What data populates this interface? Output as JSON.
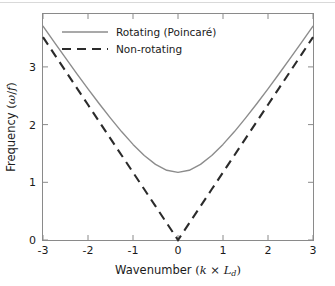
{
  "chart_data": {
    "type": "line",
    "title": "",
    "xlabel": "Wavenumber  (k × L_d)",
    "ylabel": "Frequency  (ω/f)",
    "xlim": [
      -3,
      3
    ],
    "ylim": [
      0,
      3.35
    ],
    "xticks": [
      -3,
      -2,
      -1,
      0,
      1,
      2,
      3
    ],
    "xticklabels": [
      "-3",
      "-2",
      "-1",
      "0",
      "1",
      "2",
      "3"
    ],
    "yticks": [
      0,
      1,
      2,
      3
    ],
    "yticklabels": [
      "0",
      "1",
      "2",
      "3"
    ],
    "grid": false,
    "legend_position": "upper-center",
    "x": [
      -3,
      -2.75,
      -2.5,
      -2.25,
      -2,
      -1.75,
      -1.5,
      -1.25,
      -1,
      -0.75,
      -0.5,
      -0.25,
      0,
      0.25,
      0.5,
      0.75,
      1,
      1.25,
      1.5,
      1.75,
      2,
      2.25,
      2.5,
      2.75,
      3
    ],
    "series": [
      {
        "name": "Rotating  (Poincaré)",
        "style": "solid",
        "color": "#8c8c8c",
        "formula": "omega/f = sqrt(1 + (k*Ld)^2)",
        "values": [
          3.162,
          2.926,
          2.693,
          2.462,
          2.236,
          2.015,
          1.803,
          1.6,
          1.414,
          1.25,
          1.118,
          1.031,
          1.0,
          1.031,
          1.118,
          1.25,
          1.414,
          1.6,
          1.803,
          2.015,
          2.236,
          2.462,
          2.693,
          2.926,
          3.162
        ]
      },
      {
        "name": "Non-rotating",
        "style": "dashed",
        "color": "#2b2b2b",
        "formula": "omega/f = |k*Ld|",
        "values": [
          3.0,
          2.75,
          2.5,
          2.25,
          2.0,
          1.75,
          1.5,
          1.25,
          1.0,
          0.75,
          0.5,
          0.25,
          0.0,
          0.25,
          0.5,
          0.75,
          1.0,
          1.25,
          1.5,
          1.75,
          2.0,
          2.25,
          2.5,
          2.75,
          3.0
        ]
      }
    ]
  },
  "axes": {
    "xlabel_prefix": "Wavenumber",
    "xlabel_math_k": "k",
    "xlabel_math_times": "×",
    "xlabel_math_L": "L",
    "xlabel_math_Lsub": "d",
    "ylabel_prefix": "Frequency",
    "ylabel_math_omega": "ω",
    "ylabel_math_slash": "/",
    "ylabel_math_f": "f",
    "paren_open": "(",
    "paren_close": ")"
  },
  "legend": {
    "items": [
      {
        "label": "Rotating  (Poincaré)",
        "style": "solid",
        "color": "#8c8c8c"
      },
      {
        "label": "Non-rotating",
        "style": "dashed",
        "color": "#2b2b2b"
      }
    ]
  },
  "colors": {
    "axis": "#8a8a8a",
    "text": "#1a1a1a",
    "rotating_line": "#8c8c8c",
    "nonrotating_line": "#2b2b2b",
    "background": "#ffffff",
    "top_rule": "#d9d9d9"
  }
}
